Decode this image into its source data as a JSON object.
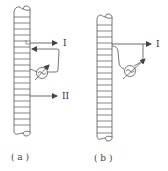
{
  "figures": [
    {
      "id": "a",
      "caption": "( a )",
      "labels": {
        "arrow_1": "I",
        "arrow_2": "II"
      },
      "components": [
        "solenoid",
        "ac-source",
        "output-arrow-I",
        "output-arrow-II"
      ]
    },
    {
      "id": "b",
      "caption": "( b )",
      "labels": {
        "arrow_1": "I"
      },
      "components": [
        "solenoid",
        "ac-source",
        "output-arrow-I"
      ]
    }
  ],
  "colors": {
    "stroke": "#555555",
    "background": "#ffffff"
  }
}
